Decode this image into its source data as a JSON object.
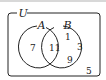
{
  "diagram": {
    "type": "venn",
    "universe_label": "U",
    "sets": [
      {
        "label": "A"
      },
      {
        "label": "B"
      }
    ],
    "regions": {
      "only_A": "7",
      "A_and_B": "11",
      "only_B_1": "1",
      "only_B_2": "3",
      "only_B_3": "9",
      "outside": "5"
    },
    "colors": {
      "stroke": "#222222",
      "background": "#ffffff"
    }
  }
}
